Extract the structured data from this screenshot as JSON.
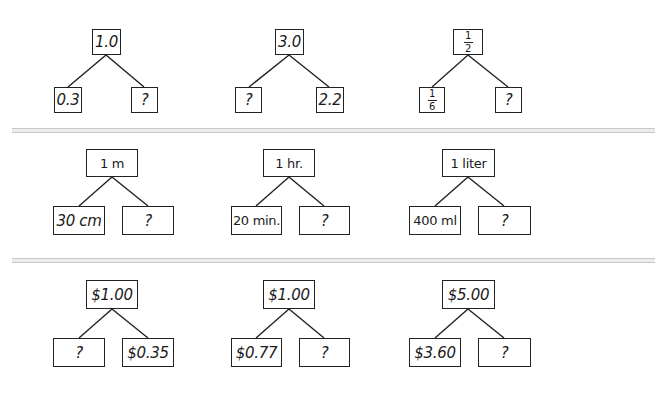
{
  "rows": [
    {
      "trees": [
        {
          "whole": "1.0",
          "left": "0.3",
          "right": "?"
        },
        {
          "whole": "3.0",
          "left": "?",
          "right": "2.2"
        },
        {
          "whole": {
            "num": "1",
            "den": "2"
          },
          "left": {
            "num": "1",
            "den": "6"
          },
          "right": "?"
        }
      ]
    },
    {
      "trees": [
        {
          "whole": "1 m",
          "left": "30 cm",
          "right": "?"
        },
        {
          "whole": "1 hr.",
          "left": "20 min.",
          "right": "?"
        },
        {
          "whole": "1 liter",
          "left": "400 ml",
          "right": "?"
        }
      ]
    },
    {
      "trees": [
        {
          "whole": "$1.00",
          "left": "?",
          "right": "$0.35"
        },
        {
          "whole": "$1.00",
          "left": "$0.77",
          "right": "?"
        },
        {
          "whole": "$5.00",
          "left": "$3.60",
          "right": "?"
        }
      ]
    }
  ]
}
